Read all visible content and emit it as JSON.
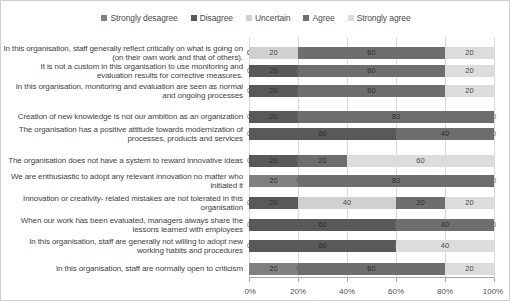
{
  "legend": {
    "items": [
      {
        "label": "Strongly desagree",
        "color": "#808080"
      },
      {
        "label": "Disagree",
        "color": "#595959"
      },
      {
        "label": "Uncertain",
        "color": "#d0d0d0"
      },
      {
        "label": "Agree",
        "color": "#6e6e6e"
      },
      {
        "label": "Strongly agree",
        "color": "#dcdcdc"
      }
    ]
  },
  "axis": {
    "ticks": [
      "0%",
      "20%",
      "40%",
      "60%",
      "80%",
      "100%"
    ],
    "tick_values": [
      0,
      20,
      40,
      60,
      80,
      100
    ]
  },
  "chart_data": {
    "type": "bar",
    "orientation": "horizontal",
    "stacked": true,
    "stacked_percent": true,
    "title": "",
    "xlabel": "",
    "ylabel": "",
    "xlim": [
      0,
      100
    ],
    "grid": true,
    "legend_position": "top-center",
    "series": [
      {
        "name": "Strongly desagree",
        "color": "#808080",
        "values": [
          0,
          0,
          0,
          0,
          0,
          0,
          20,
          0,
          0,
          0,
          20
        ]
      },
      {
        "name": "Disagree",
        "color": "#595959",
        "values": [
          0,
          20,
          20,
          20,
          60,
          20,
          0,
          20,
          60,
          60,
          0
        ]
      },
      {
        "name": "Uncertain",
        "color": "#d0d0d0",
        "values": [
          20,
          0,
          0,
          0,
          0,
          0,
          0,
          40,
          0,
          0,
          0
        ]
      },
      {
        "name": "Agree",
        "color": "#6e6e6e",
        "values": [
          60,
          60,
          60,
          80,
          40,
          20,
          80,
          20,
          40,
          0,
          60
        ]
      },
      {
        "name": "Strongly agree",
        "color": "#dcdcdc",
        "values": [
          20,
          20,
          20,
          0,
          0,
          60,
          0,
          20,
          0,
          40,
          20
        ]
      }
    ],
    "categories": [
      "In this organisation, staff generally reflect critically on what is going on (on their own work and that of others).",
      "It is not a custom in this organisation to use monitoring and evaluation results for corrective measures.",
      "In this organisation, monitoring and evaluation are seen as normal and ongoing processes",
      "Creation of new knowledge is not our ambition as an organization",
      "The organisation has a positive attitude towards modernization of processes, products and services",
      "The organisation does not have a system to reward innovative ideas",
      "We are enthusiastic to adopt any relevant innovation no matter who initiated it",
      "Innovation or creativity- related mistakes are not tolerated in this organisation",
      "When our work has been evaluated, managers always share the lessons learned with employees",
      "In this organisation, staff are generally not willing to adopt new working habits and procedures",
      "In this organisation, staff are normally open to criticism"
    ]
  }
}
